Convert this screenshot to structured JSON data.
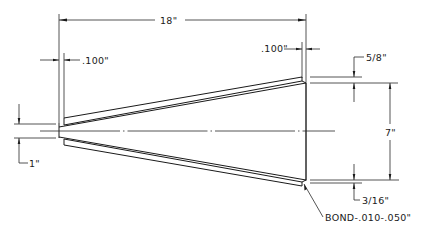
{
  "drawing": {
    "subject": "Conical shell cross-section with bonded inner liner",
    "dimensions": {
      "overall_length": "18\"",
      "left_wall_thickness": ".100\"",
      "right_wall_thickness": ".100\"",
      "top_flange_offset": "5/8\"",
      "large_end_diameter": "7\"",
      "bottom_flange_offset": "3/16\"",
      "small_end_diameter": "1\""
    },
    "notes": {
      "bond": "BOND-.010-.050\""
    }
  }
}
